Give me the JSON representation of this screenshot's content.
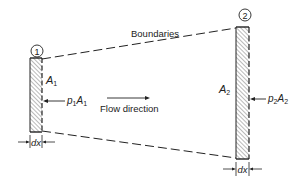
{
  "diagram": {
    "boundaries_label": "Boundaries",
    "section1": {
      "number": "1",
      "area_symbol": "A",
      "area_sub": "1",
      "force_p": "p",
      "force_p_sub": "1",
      "force_a": "A",
      "force_a_sub": "1",
      "thickness": "dx"
    },
    "section2": {
      "number": "2",
      "area_symbol": "A",
      "area_sub": "2",
      "force_p": "p",
      "force_p_sub": "2",
      "force_a": "A",
      "force_a_sub": "2",
      "thickness": "dx"
    },
    "flow_label": "Flow direction",
    "colors": {
      "line": "#222222",
      "hatch": "#555555",
      "background": "#ffffff"
    }
  }
}
